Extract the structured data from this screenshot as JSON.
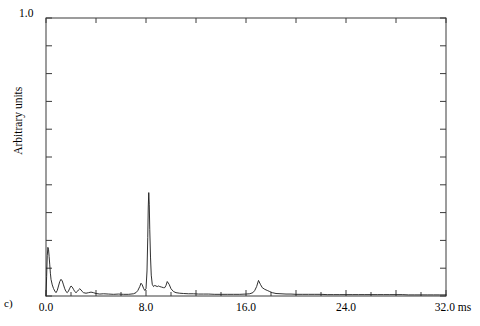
{
  "figure": {
    "panel_label": "c)",
    "ylabel": "Arbitrary units",
    "background": "#ffffff",
    "line_color": "#1a1a1a",
    "axis_color": "#3a3a3a"
  },
  "chart_data": {
    "type": "line",
    "title": "",
    "subtitle": "",
    "panel": "c)",
    "xlabel": "ms",
    "ylabel": "Arbitrary units",
    "xlim": [
      0.0,
      32.0
    ],
    "ylim": [
      0.0,
      1.0
    ],
    "grid": false,
    "legend": null,
    "x_tick_labels": [
      "0.0",
      "8.0",
      "16.0",
      "24.0",
      "32.0 ms"
    ],
    "x_tick_values": [
      0.0,
      8.0,
      16.0,
      24.0,
      32.0
    ],
    "x_minor_tick_step": 2.0,
    "x_major_tick_step": 4.0,
    "y_tick_labels": [
      "1.0"
    ],
    "y_tick_values": [
      1.0
    ],
    "y_minor_tick_step": 0.1,
    "units": "ms",
    "annotations": [],
    "series": [
      {
        "name": "signal",
        "x": [
          0.0,
          0.05,
          0.1,
          0.15,
          0.2,
          0.25,
          0.3,
          0.35,
          0.4,
          0.5,
          0.6,
          0.7,
          0.8,
          0.9,
          1.0,
          1.1,
          1.2,
          1.3,
          1.4,
          1.5,
          1.6,
          1.7,
          1.8,
          1.9,
          2.0,
          2.1,
          2.2,
          2.3,
          2.4,
          2.5,
          2.6,
          2.7,
          2.8,
          2.9,
          3.0,
          3.2,
          3.4,
          3.6,
          3.8,
          4.0,
          4.3,
          4.6,
          5.0,
          5.4,
          5.8,
          6.2,
          6.6,
          7.0,
          7.2,
          7.35,
          7.5,
          7.6,
          7.7,
          7.8,
          7.9,
          8.0,
          8.08,
          8.14,
          8.18,
          8.22,
          8.26,
          8.3,
          8.36,
          8.42,
          8.5,
          8.6,
          8.7,
          8.8,
          8.9,
          9.0,
          9.1,
          9.25,
          9.4,
          9.5,
          9.6,
          9.7,
          9.85,
          10.0,
          10.2,
          10.4,
          10.7,
          11.0,
          11.4,
          11.8,
          12.2,
          12.6,
          13.0,
          13.5,
          14.0,
          14.5,
          15.0,
          15.5,
          16.0,
          16.3,
          16.55,
          16.7,
          16.85,
          17.0,
          17.15,
          17.3,
          17.5,
          17.7,
          17.9,
          18.1,
          18.4,
          18.8,
          19.2,
          19.6,
          20.0,
          20.5,
          21.0,
          21.5,
          22.0,
          22.5,
          23.0,
          23.5,
          24.0,
          24.5,
          25.0,
          25.5,
          26.0,
          26.5,
          27.0,
          27.5,
          28.0,
          28.5,
          29.0,
          29.5,
          30.0,
          30.5,
          31.0,
          31.5,
          32.0
        ],
        "y": [
          0.0,
          0.07,
          0.145,
          0.175,
          0.168,
          0.142,
          0.112,
          0.082,
          0.06,
          0.04,
          0.027,
          0.018,
          0.012,
          0.02,
          0.036,
          0.052,
          0.06,
          0.054,
          0.04,
          0.026,
          0.016,
          0.012,
          0.018,
          0.028,
          0.036,
          0.032,
          0.024,
          0.016,
          0.012,
          0.016,
          0.022,
          0.026,
          0.022,
          0.016,
          0.012,
          0.01,
          0.012,
          0.014,
          0.012,
          0.009,
          0.007,
          0.008,
          0.007,
          0.006,
          0.007,
          0.006,
          0.006,
          0.008,
          0.012,
          0.02,
          0.034,
          0.046,
          0.04,
          0.028,
          0.02,
          0.026,
          0.09,
          0.21,
          0.32,
          0.372,
          0.33,
          0.24,
          0.14,
          0.075,
          0.042,
          0.034,
          0.038,
          0.036,
          0.034,
          0.036,
          0.034,
          0.032,
          0.03,
          0.03,
          0.038,
          0.052,
          0.042,
          0.026,
          0.016,
          0.012,
          0.01,
          0.009,
          0.008,
          0.008,
          0.007,
          0.007,
          0.007,
          0.006,
          0.006,
          0.006,
          0.006,
          0.006,
          0.007,
          0.008,
          0.012,
          0.02,
          0.034,
          0.056,
          0.042,
          0.03,
          0.024,
          0.02,
          0.016,
          0.012,
          0.009,
          0.008,
          0.007,
          0.007,
          0.006,
          0.006,
          0.006,
          0.006,
          0.006,
          0.005,
          0.005,
          0.005,
          0.005,
          0.005,
          0.005,
          0.005,
          0.005,
          0.005,
          0.005,
          0.005,
          0.005,
          0.005,
          0.004,
          0.004,
          0.004,
          0.004,
          0.004,
          0.004,
          0.004
        ]
      }
    ]
  }
}
